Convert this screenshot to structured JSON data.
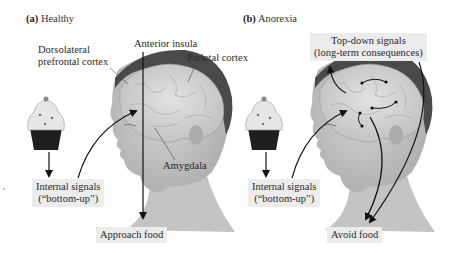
{
  "panels": [
    {
      "letter": "(a)",
      "title": "Healthy",
      "labels": {
        "dlpfc_line1": "Dorsolateral",
        "dlpfc_line2": "prefrontal cortex",
        "anterior_insula": "Anterior insula",
        "parietal_cortex": "Parietal cortex",
        "amygdala": "Amygdala"
      },
      "boxes": {
        "internal_line1": "Internal signals",
        "internal_line2": "(“bottom-up”)",
        "outcome": "Approach food"
      }
    },
    {
      "letter": "(b)",
      "title": "Anorexia",
      "boxes": {
        "topdown_line1": "Top-down signals",
        "topdown_line2": "(long-term consequences)",
        "internal_line1": "Internal signals",
        "internal_line2": "(“bottom-up”)",
        "outcome": "Avoid food"
      }
    }
  ],
  "colors": {
    "label_box": "#ececec",
    "hair": "#4a4a4a",
    "brain": "#cfcfcf",
    "skin": "#b9b9b9",
    "arrow": "#111111"
  },
  "icons": [
    "cupcake-icon",
    "head-brain-illustration"
  ]
}
